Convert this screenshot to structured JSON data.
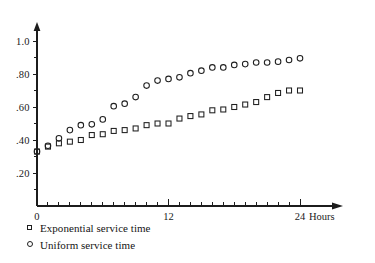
{
  "chart_data": {
    "type": "scatter",
    "title": "",
    "xlabel": "Hours",
    "ylabel": "",
    "xlim": [
      0,
      24
    ],
    "ylim": [
      0,
      1.1
    ],
    "grid": false,
    "legend_position": "below-left",
    "x_tick_labels": [
      "0",
      "12",
      "24"
    ],
    "x_tick_values": [
      0,
      12,
      24
    ],
    "x_minor_tick_step": 1,
    "y_tick_labels": [
      "1.0",
      ".80",
      ".60",
      ".40",
      ".20"
    ],
    "y_tick_values": [
      1.0,
      0.8,
      0.6,
      0.4,
      0.2
    ],
    "y_minor_tick_values": [
      0.1,
      0.3,
      0.5,
      0.7,
      0.9
    ],
    "x_axis_unit": "Hours",
    "x": [
      0,
      1,
      2,
      3,
      4,
      5,
      6,
      7,
      8,
      9,
      10,
      11,
      12,
      13,
      14,
      15,
      16,
      17,
      18,
      19,
      20,
      21,
      22,
      23,
      24
    ],
    "series": [
      {
        "name": "Exponential service time",
        "marker": "square",
        "values": [
          0.33,
          0.36,
          0.38,
          0.39,
          0.4,
          0.43,
          0.435,
          0.455,
          0.46,
          0.47,
          0.49,
          0.5,
          0.5,
          0.53,
          0.545,
          0.555,
          0.58,
          0.585,
          0.6,
          0.615,
          0.63,
          0.66,
          0.685,
          0.7,
          0.7
        ]
      },
      {
        "name": "Uniform service time",
        "marker": "circle",
        "values": [
          0.33,
          0.365,
          0.41,
          0.46,
          0.49,
          0.495,
          0.525,
          0.605,
          0.62,
          0.66,
          0.73,
          0.76,
          0.77,
          0.78,
          0.805,
          0.82,
          0.84,
          0.84,
          0.855,
          0.86,
          0.87,
          0.87,
          0.875,
          0.885,
          0.895
        ]
      }
    ]
  },
  "legend": {
    "items": [
      {
        "marker": "square",
        "label": "Exponential service time"
      },
      {
        "marker": "circle",
        "label": "Uniform service time"
      }
    ]
  },
  "colors": {
    "ink": "#1c1c1c",
    "background": "#ffffff"
  }
}
